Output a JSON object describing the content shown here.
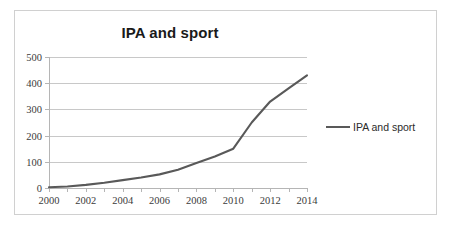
{
  "chart_data": {
    "type": "line",
    "title": "IPA and sport",
    "xlabel": "",
    "ylabel": "",
    "grid": true,
    "legend_position": "right",
    "xlim": [
      2000,
      2014
    ],
    "ylim": [
      0,
      500
    ],
    "y_ticks": [
      0,
      100,
      200,
      300,
      400,
      500
    ],
    "x_tick_labels": [
      2000,
      2002,
      2004,
      2006,
      2008,
      2010,
      2012,
      2014
    ],
    "x_all_ticks": [
      2000,
      2001,
      2002,
      2003,
      2004,
      2005,
      2006,
      2007,
      2008,
      2009,
      2010,
      2011,
      2012,
      2013,
      2014
    ],
    "series": [
      {
        "name": "IPA and sport",
        "color": "#595959",
        "x": [
          2000,
          2001,
          2002,
          2003,
          2004,
          2005,
          2006,
          2007,
          2008,
          2009,
          2010,
          2011,
          2012,
          2013,
          2014
        ],
        "values": [
          3,
          6,
          12,
          20,
          30,
          40,
          52,
          70,
          95,
          120,
          150,
          250,
          330,
          380,
          430
        ]
      }
    ]
  },
  "legend": {
    "entries": [
      {
        "label": "IPA and sport",
        "color": "#595959"
      }
    ]
  },
  "colors": {
    "series_line": "#595959",
    "gridline": "#c8c8c8",
    "axis": "#b5b5b5",
    "frame_border": "#d0d0d0",
    "title_text": "#1a1a1a",
    "tick_text": "#3b3b3b",
    "background": "#ffffff"
  }
}
